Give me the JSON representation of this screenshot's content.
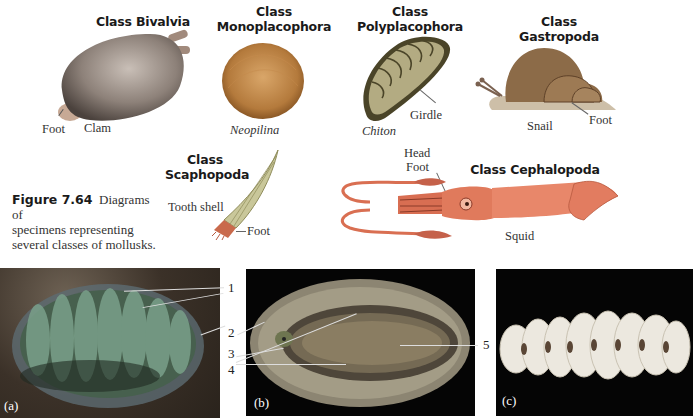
{
  "figure": {
    "number": "Figure 7.64",
    "caption": "Diagrams of specimens representing several classes of mollusks.",
    "caption_lines": [
      "Diagrams of",
      "specimens representing",
      "several classes of mollusks."
    ]
  },
  "classes": {
    "bivalvia": {
      "title": "Class Bivalvia",
      "specimen": "Clam",
      "labels": [
        "Foot"
      ]
    },
    "monoplacophora": {
      "title_line1": "Class",
      "title_line2": "Monoplacophora",
      "specimen": "Neopilina"
    },
    "polyplacophora": {
      "title_line1": "Class",
      "title_line2": "Polyplacophora",
      "specimen": "Chiton",
      "labels": [
        "Girdle"
      ]
    },
    "gastropoda": {
      "title": "Class Gastropoda",
      "specimen": "Snail",
      "labels": [
        "Foot"
      ]
    },
    "scaphopoda": {
      "title_line1": "Class",
      "title_line2": "Scaphopoda",
      "specimen": "Tooth shell",
      "labels": [
        "Foot"
      ]
    },
    "cephalopoda": {
      "title": "Class Cephalopoda",
      "specimen": "Squid",
      "labels": [
        "Head",
        "Foot"
      ]
    }
  },
  "photos": {
    "a": {
      "label": "(a)",
      "callouts": [
        "1",
        "2",
        "3",
        "4"
      ]
    },
    "b": {
      "label": "(b)",
      "callouts": [
        "5"
      ]
    },
    "c": {
      "label": "(c)"
    }
  },
  "colors": {
    "clam": "#8a7d74",
    "neopilina": "#b07a3e",
    "chiton": "#9c9468",
    "snail": "#8a6a48",
    "squid": "#e0775a",
    "photo_bg": "#050505"
  }
}
